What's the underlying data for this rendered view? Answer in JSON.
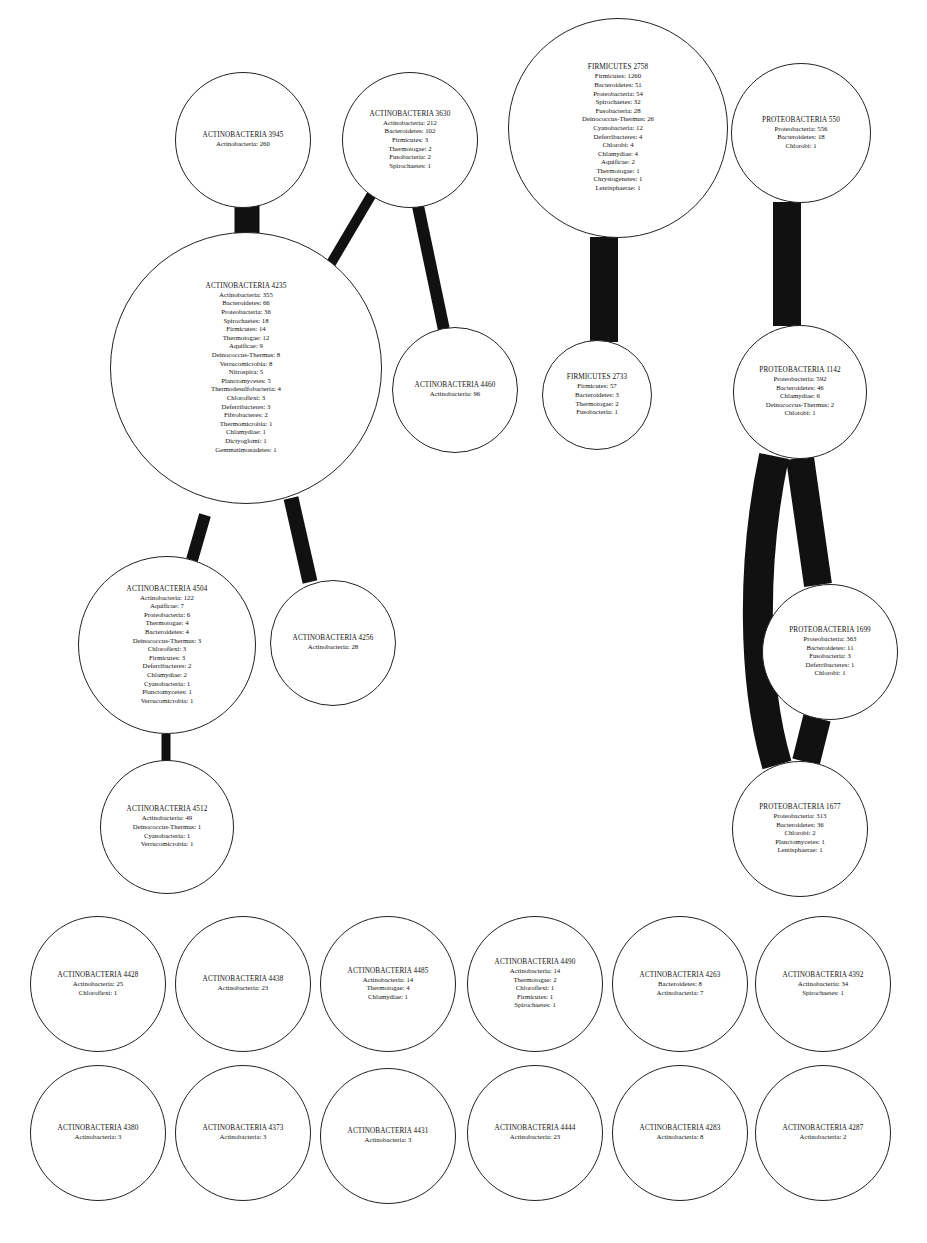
{
  "diagram": {
    "type": "cluster-network",
    "edge_color": "#111111",
    "node_border_color": "#222222",
    "nodes": [
      {
        "id": "a3945",
        "cx": 243,
        "cy": 140,
        "r": 68,
        "title": "ACTINOBACTERIA 3945",
        "rows": [
          "Actinobacteria: 260"
        ]
      },
      {
        "id": "a3630",
        "cx": 410,
        "cy": 140,
        "r": 68,
        "title": "ACTINOBACTERIA 3630",
        "rows": [
          "Actinobacteria: 212",
          "Bacteroidetes: 102",
          "Firmicutes: 3",
          "Thermotogae: 2",
          "Fusobacteria: 2",
          "Spirochaetes: 1"
        ]
      },
      {
        "id": "f2758",
        "cx": 618,
        "cy": 128,
        "r": 110,
        "title": "FIRMICUTES 2758",
        "rows": [
          "Firmicutes: 1260",
          "Bacteroidetes: 51",
          "Proteobacteria: 54",
          "Spirochaetes: 32",
          "Fusobacteria: 28",
          "Deinococcus-Thermus: 26",
          "Cyanobacteria: 12",
          "Deferribacteres: 4",
          "Chlorobi: 4",
          "Chlamydiae: 4",
          "Aquificae: 2",
          "Thermotogae: 1",
          "Chrysiogenetes: 1",
          "Lentisphaerae: 1"
        ]
      },
      {
        "id": "p550",
        "cx": 801,
        "cy": 133,
        "r": 70,
        "title": "PROTEOBACTERIA 550",
        "rows": [
          "Proteobacteria: 556",
          "Bacteroidetes: 18",
          "Chlorobi: 1"
        ]
      },
      {
        "id": "a4235",
        "cx": 246,
        "cy": 368,
        "r": 136,
        "title": "ACTINOBACTERIA 4235",
        "rows": [
          "Actinobacteria: 355",
          "Bacteroidetes: 66",
          "Proteobacteria: 36",
          "Spirochaetes: 18",
          "Firmicutes: 14",
          "Thermotogae: 12",
          "Aquificae: 9",
          "Deinococcus-Thermus: 8",
          "Verrucomicrobia: 8",
          "Nitrospira: 5",
          "Planctomycetes: 5",
          "Thermodesulfobacteria: 4",
          "Chloroflexi: 3",
          "Deferribacteres: 3",
          "Fibrobacteres: 2",
          "Thermomicrobia: 1",
          "Chlamydiae: 1",
          "Dictyoglomi: 1",
          "Gemmatimonadetes: 1"
        ]
      },
      {
        "id": "a4460",
        "cx": 455,
        "cy": 390,
        "r": 63,
        "title": "ACTINOBACTERIA 4460",
        "rows": [
          "Actinobacteria: 96"
        ]
      },
      {
        "id": "f2733",
        "cx": 597,
        "cy": 395,
        "r": 55,
        "title": "FIRMICUTES 2733",
        "rows": [
          "Firmicutes: 57",
          "Bacteroidetes: 3",
          "Thermotogae: 2",
          "Fusobacteria: 1"
        ]
      },
      {
        "id": "p1142",
        "cx": 800,
        "cy": 392,
        "r": 67,
        "title": "PROTEOBACTERIA 1142",
        "rows": [
          "Proteobacteria: 592",
          "Bacteroidetes: 46",
          "Chlamydiae: 6",
          "Deinococcus-Thermus: 2",
          "Chlorobi: 1"
        ]
      },
      {
        "id": "a4504",
        "cx": 167,
        "cy": 645,
        "r": 89,
        "title": "ACTINOBACTERIA 4504",
        "rows": [
          "Actinobacteria: 122",
          "Aquificae: 7",
          "Proteobacteria: 6",
          "Thermotogae: 4",
          "Bacteroidetes: 4",
          "Deinococcus-Thermus: 3",
          "Chloroflexi: 3",
          "Firmicutes: 3",
          "Deferribacteres: 2",
          "Chlamydiae: 2",
          "Cyanobacteria: 1",
          "Planctomycetes: 1",
          "Verrucomicrobia: 1"
        ]
      },
      {
        "id": "a4256",
        "cx": 333,
        "cy": 643,
        "r": 63,
        "title": "ACTINOBACTERIA 4256",
        "rows": [
          "Actinobacteria: 28"
        ]
      },
      {
        "id": "p1699",
        "cx": 830,
        "cy": 652,
        "r": 68,
        "title": "PROTEOBACTERIA 1699",
        "rows": [
          "Proteobacteria: 363",
          "Bacteroidetes: 11",
          "Fusobacteria: 3",
          "Deferribacteres: 1",
          "Chlorobi: 1"
        ]
      },
      {
        "id": "a4512",
        "cx": 167,
        "cy": 827,
        "r": 67,
        "title": "ACTINOBACTERIA 4512",
        "rows": [
          "Actinobacteria: 49",
          "Deinococcus-Thermus: 1",
          "Cyanobacteria: 1",
          "Verrucomicrobia: 1"
        ]
      },
      {
        "id": "p1677",
        "cx": 800,
        "cy": 829,
        "r": 68,
        "title": "PROTEOBACTERIA 1677",
        "rows": [
          "Proteobacteria: 313",
          "Bacteroidetes: 36",
          "Chlorobi: 2",
          "Planctomycetes: 1",
          "Lentisphaerae: 1"
        ]
      },
      {
        "id": "a4428",
        "cx": 98,
        "cy": 984,
        "r": 68,
        "title": "ACTINOBACTERIA 4428",
        "rows": [
          "Actinobacteria: 25",
          "Chloroflexi: 1"
        ]
      },
      {
        "id": "a4438",
        "cx": 243,
        "cy": 984,
        "r": 68,
        "title": "ACTINOBACTERIA 4438",
        "rows": [
          "Actinobacteria: 23"
        ]
      },
      {
        "id": "a4485",
        "cx": 388,
        "cy": 984,
        "r": 68,
        "title": "ACTINOBACTERIA 4485",
        "rows": [
          "Actinobacteria: 14",
          "Thermotogae: 4",
          "Chlamydiae: 1"
        ]
      },
      {
        "id": "a4490",
        "cx": 535,
        "cy": 984,
        "r": 68,
        "title": "ACTINOBACTERIA 4490",
        "rows": [
          "Actinobacteria: 14",
          "Thermotogae: 2",
          "Chloroflexi: 1",
          "Firmicutes: 1",
          "Spirochaetes: 1"
        ]
      },
      {
        "id": "a4263",
        "cx": 680,
        "cy": 984,
        "r": 68,
        "title": "ACTINOBACTERIA 4263",
        "rows": [
          "Bacteroidetes: 8",
          "Actinobacteria: 7"
        ]
      },
      {
        "id": "a4392",
        "cx": 823,
        "cy": 984,
        "r": 68,
        "title": "ACTINOBACTERIA 4392",
        "rows": [
          "Actinobacteria: 34",
          "Spirochaetes: 1"
        ]
      },
      {
        "id": "a4380",
        "cx": 98,
        "cy": 1133,
        "r": 68,
        "title": "ACTINOBACTERIA 4380",
        "rows": [
          "Actinobacteria: 3"
        ]
      },
      {
        "id": "a4373",
        "cx": 243,
        "cy": 1133,
        "r": 68,
        "title": "ACTINOBACTERIA 4373",
        "rows": [
          "Actinobacteria: 3"
        ]
      },
      {
        "id": "a4431",
        "cx": 388,
        "cy": 1136,
        "r": 68,
        "title": "ACTINOBACTERIA 4431",
        "rows": [
          "Actinobacteria: 3"
        ]
      },
      {
        "id": "a4444",
        "cx": 535,
        "cy": 1133,
        "r": 68,
        "title": "ACTINOBACTERIA 4444",
        "rows": [
          "Actinobacteria: 23"
        ]
      },
      {
        "id": "a4283",
        "cx": 680,
        "cy": 1133,
        "r": 68,
        "title": "ACTINOBACTERIA 4283",
        "rows": [
          "Actinobacteria: 8"
        ]
      },
      {
        "id": "a4287",
        "cx": 823,
        "cy": 1133,
        "r": 68,
        "title": "ACTINOBACTERIA 4287",
        "rows": [
          "Actinobacteria: 2"
        ]
      }
    ],
    "edges": [
      {
        "from": "a3945",
        "to": "a4235",
        "x1": 247,
        "y1": 205,
        "x2": 247,
        "y2": 262,
        "width": 25
      },
      {
        "from": "a3630",
        "to": "a4235",
        "x1": 372,
        "y1": 194,
        "x2": 320,
        "y2": 282,
        "width": 10
      },
      {
        "from": "a3630",
        "to": "a4460",
        "x1": 418,
        "y1": 206,
        "x2": 444,
        "y2": 330,
        "width": 12
      },
      {
        "from": "f2758",
        "to": "f2733",
        "x1": 604,
        "y1": 237,
        "x2": 604,
        "y2": 342,
        "width": 28
      },
      {
        "from": "p550",
        "to": "p1142",
        "x1": 787,
        "y1": 202,
        "x2": 787,
        "y2": 326,
        "width": 28
      },
      {
        "from": "a4235",
        "to": "a4504",
        "x1": 205,
        "y1": 515,
        "x2": 192,
        "y2": 560,
        "width": 12
      },
      {
        "from": "a4235",
        "to": "a4256",
        "x1": 291,
        "y1": 498,
        "x2": 310,
        "y2": 582,
        "width": 15
      },
      {
        "from": "a4504",
        "to": "a4512",
        "x1": 166,
        "y1": 734,
        "x2": 166,
        "y2": 761,
        "width": 9
      },
      {
        "from": "p1142",
        "to": "p1699",
        "x1": 800,
        "y1": 458,
        "x2": 818,
        "y2": 585,
        "width": 28
      },
      {
        "from": "p1699",
        "to": "p1677",
        "x1": 817,
        "y1": 718,
        "x2": 806,
        "y2": 762,
        "width": 28
      },
      {
        "from": "p1142",
        "to": "p1677",
        "path": "M 774 456 C 752 560, 752 680, 777 765",
        "width": 30
      }
    ]
  }
}
